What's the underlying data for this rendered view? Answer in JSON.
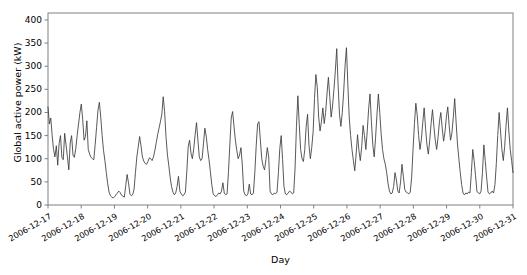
{
  "chart_data": {
    "type": "line",
    "title": "",
    "xlabel": "Day",
    "ylabel": "Global active power (kW)",
    "grid": false,
    "legend": null,
    "line_color": "#3b3b3b",
    "background_color": "#ffffff",
    "axes_color": "#808080",
    "ylim": [
      0,
      415
    ],
    "yticks": [
      0,
      50,
      100,
      150,
      200,
      250,
      300,
      350,
      400
    ],
    "ytick_labels": [
      "0",
      "50",
      "100",
      "150",
      "200",
      "250",
      "300",
      "350",
      "400"
    ],
    "xlim": [
      "2006-12-17",
      "2006-12-31"
    ],
    "xticks": [
      "2006-12-17",
      "2006-12-18",
      "2006-12-19",
      "2006-12-20",
      "2006-12-21",
      "2006-12-22",
      "2006-12-23",
      "2006-12-24",
      "2006-12-25",
      "2006-12-26",
      "2006-12-27",
      "2006-12-28",
      "2006-12-29",
      "2006-12-30",
      "2006-12-31"
    ],
    "x_index": [
      0,
      1,
      2,
      3,
      4,
      5,
      6,
      7,
      8,
      9,
      10,
      11,
      12,
      13,
      14,
      15,
      16,
      17,
      18,
      19,
      20,
      21,
      22,
      23,
      24,
      25,
      26,
      27,
      28,
      29,
      30,
      31,
      32,
      33,
      34,
      35,
      36,
      37,
      38,
      39,
      40,
      41,
      42,
      43,
      44,
      45,
      46,
      47,
      48,
      49,
      50,
      51,
      52,
      53,
      54,
      55,
      56,
      57,
      58,
      59,
      60,
      61,
      62,
      63,
      64,
      65,
      66,
      67,
      68,
      69,
      70,
      71,
      72,
      73,
      74,
      75,
      76,
      77,
      78,
      79,
      80,
      81,
      82,
      83,
      84,
      85,
      86,
      87,
      88,
      89,
      90,
      91,
      92,
      93,
      94,
      95,
      96,
      97,
      98,
      99,
      100,
      101,
      102,
      103,
      104,
      105,
      106,
      107,
      108,
      109,
      110,
      111,
      112,
      113,
      114,
      115,
      116,
      117,
      118,
      119,
      120,
      121,
      122,
      123,
      124,
      125,
      126,
      127,
      128,
      129,
      130,
      131,
      132,
      133,
      134,
      135,
      136,
      137,
      138,
      139,
      140,
      141,
      142,
      143,
      144,
      145,
      146,
      147,
      148,
      149,
      150,
      151,
      152,
      153,
      154,
      155,
      156,
      157,
      158,
      159,
      160,
      161,
      162,
      163,
      164,
      165,
      166,
      167,
      168,
      169,
      170,
      171,
      172,
      173,
      174,
      175,
      176,
      177,
      178,
      179,
      180,
      181,
      182,
      183,
      184,
      185,
      186,
      187,
      188,
      189,
      190,
      191,
      192,
      193,
      194,
      195,
      196,
      197,
      198,
      199,
      200,
      201,
      202,
      203,
      204,
      205,
      206,
      207,
      208,
      209,
      210,
      211,
      212,
      213,
      214,
      215,
      216,
      217,
      218,
      219,
      220,
      221,
      222,
      223,
      224,
      225,
      226,
      227,
      228,
      229,
      230,
      231,
      232,
      233,
      234,
      235,
      236,
      237,
      238,
      239,
      240,
      241,
      242,
      243,
      244,
      245,
      246,
      247,
      248,
      249,
      250,
      251,
      252,
      253,
      254,
      255,
      256,
      257,
      258,
      259,
      260,
      261,
      262,
      263,
      264,
      265,
      266,
      267,
      268,
      269,
      270,
      271,
      272,
      273,
      274,
      275,
      276,
      277,
      278,
      279,
      280,
      281,
      282,
      283,
      284,
      285,
      286,
      287,
      288,
      289,
      290,
      291,
      292,
      293,
      294,
      295,
      296,
      297,
      298,
      299,
      300,
      301,
      302,
      303,
      304,
      305,
      306,
      307,
      308,
      309,
      310,
      311,
      312,
      313,
      314,
      315,
      316,
      317,
      318,
      319,
      320,
      321,
      322,
      323,
      324,
      325,
      326,
      327,
      328,
      329,
      330,
      331,
      332,
      333,
      334,
      335
    ],
    "values": [
      212,
      175,
      188,
      150,
      120,
      104,
      128,
      86,
      133,
      150,
      103,
      98,
      155,
      130,
      104,
      76,
      134,
      150,
      108,
      103,
      122,
      150,
      175,
      200,
      218,
      185,
      140,
      148,
      182,
      120,
      110,
      103,
      100,
      98,
      131,
      168,
      205,
      222,
      190,
      150,
      118,
      96,
      70,
      46,
      28,
      20,
      17,
      15,
      18,
      22,
      26,
      30,
      27,
      21,
      19,
      17,
      42,
      66,
      48,
      24,
      20,
      22,
      34,
      70,
      104,
      125,
      148,
      128,
      104,
      95,
      90,
      88,
      94,
      102,
      100,
      96,
      104,
      118,
      135,
      152,
      166,
      180,
      196,
      234,
      202,
      148,
      110,
      86,
      60,
      40,
      28,
      22,
      26,
      40,
      62,
      30,
      24,
      20,
      22,
      28,
      72,
      126,
      140,
      112,
      100,
      122,
      152,
      178,
      140,
      104,
      96,
      100,
      132,
      166,
      148,
      120,
      98,
      72,
      44,
      24,
      20,
      18,
      22,
      26,
      24,
      30,
      48,
      26,
      22,
      24,
      70,
      130,
      188,
      202,
      170,
      140,
      118,
      100,
      108,
      124,
      86,
      30,
      22,
      20,
      24,
      45,
      24,
      22,
      26,
      70,
      128,
      175,
      180,
      140,
      100,
      84,
      76,
      98,
      124,
      104,
      30,
      24,
      22,
      26,
      24,
      28,
      70,
      122,
      150,
      98,
      40,
      24,
      22,
      26,
      30,
      28,
      24,
      26,
      80,
      170,
      236,
      174,
      120,
      100,
      94,
      120,
      170,
      196,
      130,
      100,
      124,
      158,
      230,
      282,
      254,
      190,
      160,
      180,
      210,
      176,
      200,
      240,
      276,
      234,
      190,
      214,
      250,
      290,
      338,
      260,
      196,
      170,
      200,
      244,
      300,
      340,
      262,
      190,
      150,
      120,
      96,
      74,
      110,
      152,
      118,
      96,
      126,
      172,
      150,
      120,
      160,
      208,
      240,
      180,
      130,
      104,
      146,
      196,
      240,
      200,
      154,
      120,
      100,
      88,
      70,
      46,
      30,
      24,
      26,
      40,
      70,
      54,
      30,
      26,
      50,
      88,
      62,
      34,
      28,
      26,
      24,
      28,
      60,
      120,
      176,
      220,
      194,
      150,
      120,
      142,
      178,
      210,
      166,
      130,
      110,
      140,
      176,
      206,
      170,
      140,
      120,
      146,
      180,
      200,
      166,
      138,
      158,
      190,
      212,
      172,
      140,
      156,
      190,
      230,
      180,
      132,
      100,
      70,
      44,
      26,
      22,
      26,
      24,
      28,
      26,
      70,
      120,
      96,
      64,
      30,
      26,
      24,
      30,
      70,
      130,
      96,
      60,
      28,
      24,
      26,
      30,
      26,
      44,
      90,
      150,
      200,
      160,
      120,
      96,
      126,
      172,
      210,
      160,
      120,
      96,
      70
    ]
  },
  "axis_labels": {
    "y_title": "Global active power (kW)",
    "x_title": "Day"
  }
}
